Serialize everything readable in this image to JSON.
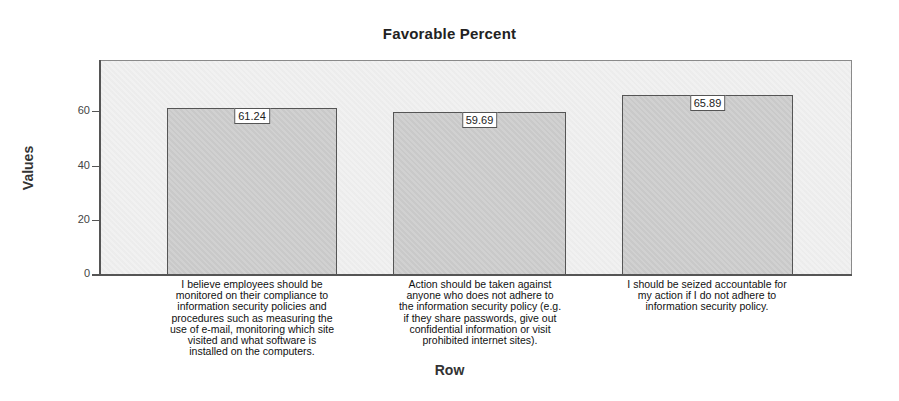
{
  "chart_data": {
    "type": "bar",
    "title": "Favorable Percent",
    "xlabel": "Row",
    "ylabel": "Values",
    "ylim": [
      0,
      78
    ],
    "yticks": [
      0,
      20,
      40,
      60
    ],
    "grid": false,
    "legend": null,
    "categories": [
      "I believe employees should be monitored on their compliance to information security policies and procedures such as measuring the use of e-mail, monitoring which site visited and what software is installed on the computers.",
      "Action should be taken against anyone who does not adhere to the information security policy (e.g. if they share passwords, give out confidential information or visit prohibited internet sites).",
      "I should be seized accountable for my action if I do not adhere to information security policy."
    ],
    "values": [
      61.24,
      59.69,
      65.89
    ],
    "value_labels": [
      "61.24",
      "59.69",
      "65.89"
    ],
    "colors": {
      "bar_fill": "#cfcfcf",
      "bar_border": "#555555",
      "plot_bg": "#f1f1f1"
    }
  },
  "display": {
    "title": "Favorable Percent",
    "xlabel": "Row",
    "ylabel": "Values",
    "yticks": [
      "0",
      "20",
      "40",
      "60"
    ],
    "cat_lines": [
      "I believe employees should be\nmonitored on their compliance to\ninformation security policies and\nprocedures such as measuring the\nuse of e-mail, monitoring which site\nvisited and what software is\ninstalled on the computers.",
      "Action should be taken against\nanyone who does not adhere to\nthe information security policy (e.g.\nif they share passwords, give out\nconfidential information or visit\nprohibited internet sites).",
      "I should be seized accountable for\nmy action if I do not adhere to\ninformation security policy."
    ]
  }
}
